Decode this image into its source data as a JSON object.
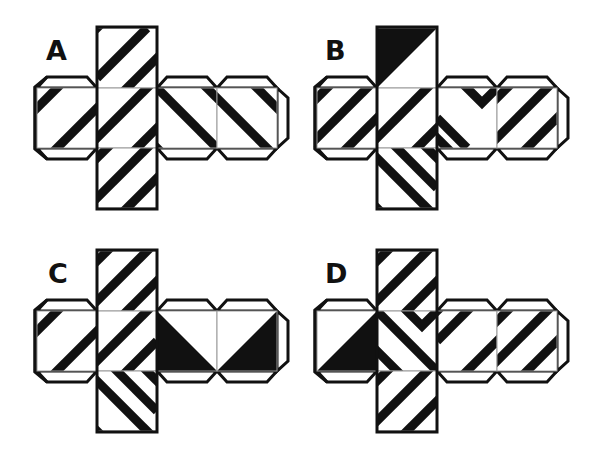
{
  "puzzle": {
    "colors": {
      "ink": "#111111",
      "paper": "#ffffff",
      "hinge": "#9a9a9a"
    },
    "face_size": 60,
    "stripe_width": 9,
    "nets": [
      {
        "label": "A",
        "origin": [
          0,
          0
        ],
        "label_pos": [
          46,
          37
        ],
        "faces": [
          {
            "id": "top",
            "pos": [
              97,
              28
            ],
            "lines": [
              [
                [
                  -10,
                  10
                ],
                [
                  10,
                  -10
                ]
              ],
              [
                [
                  0,
                  50
                ],
                [
                  50,
                  0
                ]
              ],
              [
                [
                  20,
                  70
                ],
                [
                  70,
                  20
                ]
              ]
            ]
          },
          {
            "id": "left",
            "pos": [
              37,
              88
            ],
            "lines": [
              [
                [
                  -10,
                  30
                ],
                [
                  30,
                  -10
                ]
              ],
              [
                [
                  10,
                  70
                ],
                [
                  70,
                  10
                ]
              ]
            ]
          },
          {
            "id": "center",
            "pos": [
              97,
              88
            ],
            "lines": [
              [
                [
                  -10,
                  60
                ],
                [
                  60,
                  -10
                ]
              ],
              [
                [
                  30,
                  70
                ],
                [
                  60,
                  40
                ],
                [
                  90,
                  70
                ]
              ]
            ]
          },
          {
            "id": "right1",
            "pos": [
              157,
              88
            ],
            "lines": [
              [
                [
                  -20,
                  -20
                ],
                [
                  60,
                  60
                ]
              ],
              [
                [
                  -30,
                  30
                ],
                [
                  10,
                  70
                ]
              ],
              [
                [
                  40,
                  -10
                ],
                [
                  70,
                  20
                ]
              ]
            ]
          },
          {
            "id": "right2",
            "pos": [
              217,
              88
            ],
            "lines": [
              [
                [
                  -40,
                  -30
                ],
                [
                  60,
                  70
                ]
              ],
              [
                [
                  30,
                  -10
                ],
                [
                  70,
                  30
                ]
              ]
            ]
          },
          {
            "id": "bottom",
            "pos": [
              97,
              148
            ],
            "lines": [
              [
                [
                  -10,
                  20
                ],
                [
                  20,
                  -10
                ]
              ],
              [
                [
                  -10,
                  60
                ],
                [
                  60,
                  -10
                ]
              ],
              [
                [
                  20,
                  70
                ],
                [
                  70,
                  20
                ]
              ]
            ]
          }
        ],
        "tabs": [
          "left-top",
          "left-bottom",
          "left-left",
          "right1-top",
          "right1-bottom",
          "right2-top",
          "right2-bottom",
          "right2-right"
        ]
      },
      {
        "label": "B",
        "origin": [
          280,
          0
        ],
        "label_pos": [
          325,
          37
        ],
        "faces": [
          {
            "id": "top",
            "pos": [
              97,
              28
            ],
            "tri": [
              [
                0,
                0
              ],
              [
                60,
                0
              ],
              [
                0,
                60
              ]
            ]
          },
          {
            "id": "left",
            "pos": [
              37,
              88
            ],
            "lines": [
              [
                [
                  -10,
                  20
                ],
                [
                  20,
                  -10
                ]
              ],
              [
                [
                  -10,
                  60
                ],
                [
                  60,
                  -10
                ]
              ],
              [
                [
                  20,
                  70
                ],
                [
                  70,
                  20
                ]
              ]
            ]
          },
          {
            "id": "center",
            "pos": [
              97,
              88
            ],
            "lines": [
              [
                [
                  -10,
                  60
                ],
                [
                  60,
                  -10
                ]
              ],
              [
                [
                  30,
                  70
                ],
                [
                  60,
                  40
                ],
                [
                  90,
                  70
                ]
              ]
            ]
          },
          {
            "id": "right1",
            "pos": [
              157,
              88
            ],
            "lines": [
              [
                [
                  20,
                  -10
                ],
                [
                  45,
                  15
                ],
                [
                  70,
                  -10
                ]
              ],
              [
                [
                  -10,
                  40
                ],
                [
                  20,
                  70
                ]
              ],
              [
                [
                  0,
                  30
                ],
                [
                  30,
                  60
                ]
              ]
            ]
          },
          {
            "id": "right2",
            "pos": [
              217,
              88
            ],
            "lines": [
              [
                [
                  -10,
                  20
                ],
                [
                  20,
                  -10
                ]
              ],
              [
                [
                  -10,
                  60
                ],
                [
                  60,
                  -10
                ]
              ],
              [
                [
                  20,
                  70
                ],
                [
                  70,
                  20
                ]
              ]
            ]
          },
          {
            "id": "bottom",
            "pos": [
              97,
              148
            ],
            "lines": [
              [
                [
                  -10,
                  0
                ],
                [
                  60,
                  70
                ]
              ],
              [
                [
                  -20,
                  40
                ],
                [
                  10,
                  70
                ]
              ],
              [
                [
                  10,
                  -10
                ],
                [
                  60,
                  40
                ]
              ],
              [
                [
                  40,
                  -10
                ],
                [
                  70,
                  20
                ]
              ]
            ]
          }
        ],
        "tabs": [
          "left-top",
          "left-bottom",
          "left-left",
          "right1-top",
          "right1-bottom",
          "right2-top",
          "right2-bottom",
          "right2-right"
        ]
      },
      {
        "label": "C",
        "origin": [
          0,
          223
        ],
        "label_pos": [
          48,
          37
        ],
        "faces": [
          {
            "id": "top",
            "pos": [
              97,
              28
            ],
            "lines": [
              [
                [
                  -10,
                  20
                ],
                [
                  20,
                  -10
                ]
              ],
              [
                [
                  -10,
                  60
                ],
                [
                  60,
                  -10
                ]
              ],
              [
                [
                  20,
                  70
                ],
                [
                  70,
                  20
                ]
              ]
            ]
          },
          {
            "id": "left",
            "pos": [
              37,
              88
            ],
            "lines": [
              [
                [
                  -10,
                  30
                ],
                [
                  30,
                  -10
                ]
              ],
              [
                [
                  10,
                  70
                ],
                [
                  70,
                  10
                ]
              ]
            ]
          },
          {
            "id": "center",
            "pos": [
              97,
              88
            ],
            "lines": [
              [
                [
                  -10,
                  60
                ],
                [
                  60,
                  -10
                ]
              ],
              [
                [
                  60,
                  30
                ],
                [
                  30,
                  60
                ],
                [
                  60,
                  90
                ]
              ]
            ]
          },
          {
            "id": "right1",
            "pos": [
              157,
              88
            ],
            "tri": [
              [
                0,
                0
              ],
              [
                60,
                60
              ],
              [
                0,
                60
              ]
            ]
          },
          {
            "id": "right2",
            "pos": [
              217,
              88
            ],
            "tri": [
              [
                60,
                0
              ],
              [
                60,
                60
              ],
              [
                0,
                60
              ]
            ]
          },
          {
            "id": "bottom",
            "pos": [
              97,
              148
            ],
            "lines": [
              [
                [
                  -10,
                  0
                ],
                [
                  60,
                  70
                ]
              ],
              [
                [
                  -20,
                  40
                ],
                [
                  10,
                  70
                ]
              ],
              [
                [
                  10,
                  -10
                ],
                [
                  60,
                  40
                ]
              ],
              [
                [
                  40,
                  -10
                ],
                [
                  70,
                  20
                ]
              ]
            ]
          }
        ],
        "tabs": [
          "left-top",
          "left-bottom",
          "left-left",
          "right1-top",
          "right1-bottom",
          "right2-top",
          "right2-bottom",
          "right2-right"
        ]
      },
      {
        "label": "D",
        "origin": [
          280,
          223
        ],
        "label_pos": [
          325,
          37
        ],
        "faces": [
          {
            "id": "top",
            "pos": [
              97,
              28
            ],
            "lines": [
              [
                [
                  -10,
                  20
                ],
                [
                  20,
                  -10
                ]
              ],
              [
                [
                  -10,
                  60
                ],
                [
                  60,
                  -10
                ]
              ],
              [
                [
                  20,
                  70
                ],
                [
                  70,
                  20
                ]
              ]
            ]
          },
          {
            "id": "left",
            "pos": [
              37,
              88
            ],
            "tri": [
              [
                60,
                0
              ],
              [
                60,
                60
              ],
              [
                0,
                60
              ]
            ]
          },
          {
            "id": "center",
            "pos": [
              97,
              88
            ],
            "lines": [
              [
                [
                  -10,
                  -10
                ],
                [
                  70,
                  70
                ]
              ],
              [
                [
                  20,
                  -10
                ],
                [
                  45,
                  15
                ],
                [
                  70,
                  -10
                ]
              ],
              [
                [
                  -10,
                  30
                ],
                [
                  20,
                  60
                ],
                [
                  -10,
                  90
                ]
              ]
            ]
          },
          {
            "id": "right1",
            "pos": [
              157,
              88
            ],
            "lines": [
              [
                [
                  -10,
                  -10
                ],
                [
                  0,
                  0
                ],
                [
                  30,
                  -30
                ]
              ],
              [
                [
                  0,
                  30
                ],
                [
                  40,
                  -10
                ]
              ],
              [
                [
                  20,
                  70
                ],
                [
                  70,
                  20
                ]
              ]
            ]
          },
          {
            "id": "right2",
            "pos": [
              217,
              88
            ],
            "lines": [
              [
                [
                  -10,
                  20
                ],
                [
                  20,
                  -10
                ]
              ],
              [
                [
                  -10,
                  60
                ],
                [
                  60,
                  -10
                ]
              ],
              [
                [
                  20,
                  70
                ],
                [
                  70,
                  20
                ]
              ]
            ]
          },
          {
            "id": "bottom",
            "pos": [
              97,
              148
            ],
            "lines": [
              [
                [
                  -10,
                  20
                ],
                [
                  20,
                  -10
                ]
              ],
              [
                [
                  -10,
                  60
                ],
                [
                  60,
                  -10
                ]
              ],
              [
                [
                  20,
                  70
                ],
                [
                  70,
                  20
                ]
              ]
            ]
          }
        ],
        "tabs": [
          "left-top",
          "left-bottom",
          "left-left",
          "right1-top",
          "right1-bottom",
          "right2-top",
          "right2-bottom",
          "right2-right"
        ]
      }
    ]
  }
}
